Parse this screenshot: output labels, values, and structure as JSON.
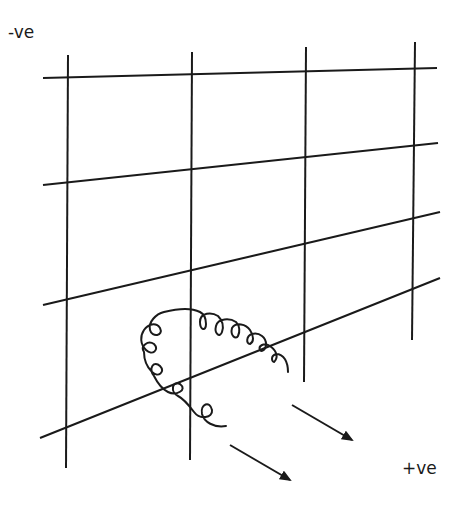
{
  "diagram": {
    "labels": {
      "negative": "-ve",
      "positive": "+ve"
    },
    "grid": {
      "vertical_lines": [
        {
          "x1": 68,
          "y1": 55,
          "x2": 66,
          "y2": 468
        },
        {
          "x1": 192,
          "y1": 52,
          "x2": 190,
          "y2": 460
        },
        {
          "x1": 306,
          "y1": 47,
          "x2": 304,
          "y2": 382
        },
        {
          "x1": 415,
          "y1": 42,
          "x2": 412,
          "y2": 340
        }
      ],
      "slanted_lines": [
        {
          "x1": 43,
          "y1": 78,
          "x2": 437,
          "y2": 68
        },
        {
          "x1": 43,
          "y1": 185,
          "x2": 438,
          "y2": 143
        },
        {
          "x1": 43,
          "y1": 305,
          "x2": 440,
          "y2": 212
        },
        {
          "x1": 40,
          "y1": 438,
          "x2": 440,
          "y2": 278
        }
      ]
    },
    "arrows": [
      {
        "name": "upper-arrow",
        "x1": 292,
        "y1": 405,
        "x2": 352,
        "y2": 440
      },
      {
        "name": "lower-arrow",
        "x1": 230,
        "y1": 445,
        "x2": 290,
        "y2": 480
      }
    ],
    "colors": {
      "stroke": "#1a1a1a",
      "background": "#ffffff"
    }
  }
}
